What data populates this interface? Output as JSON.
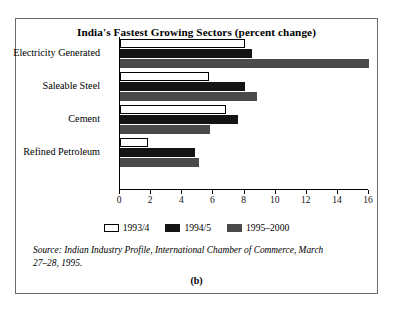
{
  "figure": {
    "title": "India's Fastest Growing Sectors (percent change)",
    "panel_caption": "(b)",
    "source_note": "Source: Indian Industry Profile, International Chamber of Commerce, March 27–28, 1995."
  },
  "chart_data": {
    "type": "bar",
    "orientation": "horizontal",
    "title": "India's Fastest Growing Sectors (percent change)",
    "xlabel": "",
    "ylabel": "",
    "xlim": [
      0,
      16
    ],
    "xticks": [
      0,
      2,
      4,
      6,
      8,
      10,
      12,
      14,
      16
    ],
    "grid": false,
    "legend_position": "bottom",
    "categories": [
      "Electricity Generated",
      "Saleable Steel",
      "Cement",
      "Refined Petroleum"
    ],
    "series": [
      {
        "name": "1993/4",
        "color": "#ffffff",
        "values": [
          8.0,
          5.7,
          6.8,
          1.8
        ]
      },
      {
        "name": "1994/5",
        "color": "#141414",
        "values": [
          8.5,
          8.0,
          7.6,
          4.8
        ]
      },
      {
        "name": "1995–2000",
        "color": "#4a4a4a",
        "values": [
          16.0,
          8.8,
          5.8,
          5.1
        ]
      }
    ]
  }
}
